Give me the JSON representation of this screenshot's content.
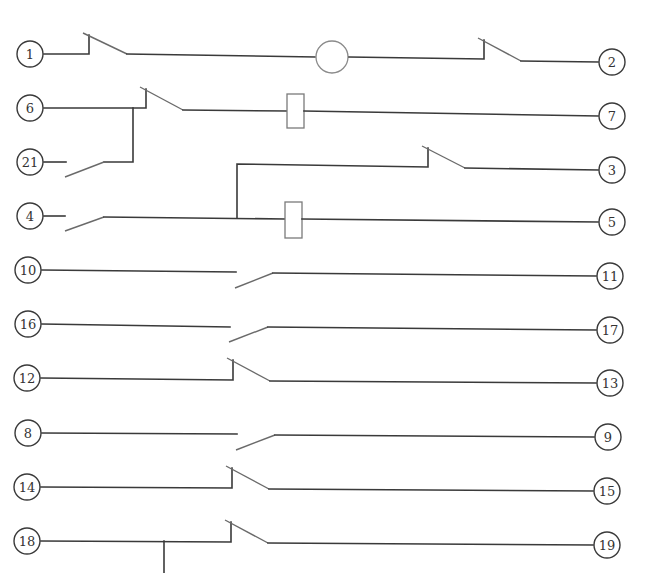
{
  "diagram": {
    "type": "relay-contact-wiring-diagram",
    "colors": {
      "wire": "#3a3a3a",
      "blade": "#6a6a6a",
      "coil": "#7a7a7a",
      "background": "#ffffff"
    },
    "terminals": [
      {
        "id": "1",
        "label": "1",
        "x": 30,
        "y": 54
      },
      {
        "id": "2",
        "label": "2",
        "x": 612,
        "y": 62
      },
      {
        "id": "6",
        "label": "6",
        "x": 30,
        "y": 108
      },
      {
        "id": "7",
        "label": "7",
        "x": 612,
        "y": 116
      },
      {
        "id": "21",
        "label": "21",
        "x": 30,
        "y": 162
      },
      {
        "id": "3",
        "label": "3",
        "x": 612,
        "y": 170
      },
      {
        "id": "4",
        "label": "4",
        "x": 30,
        "y": 216
      },
      {
        "id": "5",
        "label": "5",
        "x": 612,
        "y": 222
      },
      {
        "id": "10",
        "label": "10",
        "x": 28,
        "y": 270
      },
      {
        "id": "11",
        "label": "11",
        "x": 610,
        "y": 276
      },
      {
        "id": "16",
        "label": "16",
        "x": 28,
        "y": 324
      },
      {
        "id": "17",
        "label": "17",
        "x": 610,
        "y": 330
      },
      {
        "id": "12",
        "label": "12",
        "x": 27,
        "y": 378
      },
      {
        "id": "13",
        "label": "13",
        "x": 610,
        "y": 383
      },
      {
        "id": "8",
        "label": "8",
        "x": 28,
        "y": 433
      },
      {
        "id": "9",
        "label": "9",
        "x": 608,
        "y": 437
      },
      {
        "id": "14",
        "label": "14",
        "x": 27,
        "y": 487
      },
      {
        "id": "15",
        "label": "15",
        "x": 607,
        "y": 491
      },
      {
        "id": "18",
        "label": "18",
        "x": 27,
        "y": 541
      },
      {
        "id": "19",
        "label": "19",
        "x": 607,
        "y": 545
      }
    ],
    "components": [
      {
        "type": "lamp",
        "label": "lamp",
        "between": [
          "1",
          "2"
        ]
      },
      {
        "type": "coil",
        "label": "relay-coil-1",
        "between": [
          "6",
          "7"
        ]
      },
      {
        "type": "coil",
        "label": "relay-coil-2",
        "between": [
          "4",
          "5"
        ]
      },
      {
        "type": "nc-contact",
        "between": [
          "1",
          "lamp"
        ]
      },
      {
        "type": "nc-contact",
        "between": [
          "lamp",
          "2"
        ]
      },
      {
        "type": "nc-contact",
        "between": [
          "6",
          "coil-1"
        ]
      },
      {
        "type": "no-contact",
        "between": [
          "21",
          "6"
        ]
      },
      {
        "type": "no-contact",
        "between": [
          "4",
          "coil-2"
        ]
      },
      {
        "type": "nc-contact",
        "between": [
          "coil-2-junction",
          "3"
        ]
      },
      {
        "type": "no-contact",
        "between": [
          "10",
          "11"
        ]
      },
      {
        "type": "no-contact",
        "between": [
          "16",
          "17"
        ]
      },
      {
        "type": "nc-contact",
        "between": [
          "12",
          "13"
        ]
      },
      {
        "type": "no-contact",
        "between": [
          "8",
          "9"
        ]
      },
      {
        "type": "nc-contact",
        "between": [
          "14",
          "15"
        ]
      },
      {
        "type": "nc-contact",
        "between": [
          "18",
          "19"
        ]
      }
    ]
  }
}
